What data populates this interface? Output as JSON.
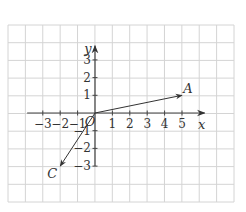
{
  "diagram": {
    "type": "coordinate-grid-vectors",
    "grid": {
      "x_min_px": 8,
      "x_max_px": 234,
      "y_min_px": 25,
      "y_max_px": 202,
      "cols": 13,
      "rows": 10,
      "line_color": "#d4d4d4"
    },
    "origin_px": {
      "x": 95,
      "y": 113
    },
    "unit_px": {
      "x": 17.4,
      "y": 17.7
    },
    "axes": {
      "color": "#444444",
      "x": {
        "label": "x",
        "from": -3.9,
        "to": 6.3,
        "ticks": [
          -3,
          -2,
          -1,
          1,
          2,
          3,
          4,
          5
        ],
        "tick_labels": [
          "−3",
          "−2",
          "−1",
          "1",
          "2",
          "3",
          "4",
          "5"
        ]
      },
      "y": {
        "label": "y",
        "from": -3,
        "to": 3.8,
        "ticks": [
          -3,
          -2,
          -1,
          1,
          2,
          3
        ],
        "tick_labels": [
          "−3",
          "−2",
          "−1",
          "1",
          "2",
          "3"
        ]
      },
      "origin_label": "O"
    },
    "vectors": [
      {
        "name": "A",
        "from": [
          0,
          0
        ],
        "to": [
          5,
          1
        ],
        "label": "A"
      },
      {
        "name": "C",
        "from": [
          0,
          0
        ],
        "to": [
          -2,
          -3
        ],
        "label": "C"
      }
    ]
  }
}
